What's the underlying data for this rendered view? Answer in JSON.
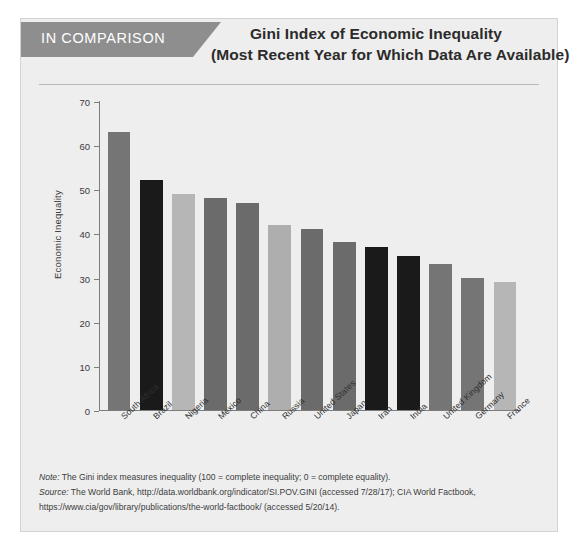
{
  "banner": {
    "label": "IN COMPARISON"
  },
  "header": {
    "title_line1": "Gini Index of Economic Inequality",
    "title_line2": "(Most Recent Year for Which Data Are Available)"
  },
  "notes": {
    "note_tag": "Note:",
    "note_text": " The Gini index measures inequality (100 = complete inequality; 0 = complete equality).",
    "source_tag": "Source:",
    "source_text": " The World Bank, http://data.worldbank.org/indicator/SI.POV.GINI (accessed 7/28/17); CIA World Factbook,",
    "source_text2": "https://www.cia/gov/library/publications/the-world-factbook/ (accessed 5/20/14)."
  },
  "colors": {
    "card_background": "#eeeeee",
    "ribbon": "#8e8e8e",
    "axis": "#7d7d7d",
    "bar_dark": "#1a1a1a",
    "bar_medium": "#757575",
    "bar_medium_dark": "#6b6b6b",
    "bar_light": "#b6b6b6"
  },
  "chart_data": {
    "type": "bar",
    "title": "Gini Index of Economic Inequality (Most Recent Year for Which Data Are Available)",
    "xlabel": "",
    "ylabel": "Economic Inequality",
    "ylim": [
      0,
      70
    ],
    "yticks": [
      0,
      10,
      20,
      30,
      40,
      50,
      60,
      70
    ],
    "grid": false,
    "legend": "none",
    "categories": [
      "South Africa",
      "Brazil",
      "Nigeria",
      "Mexico",
      "China",
      "Russia",
      "United States",
      "Japan",
      "Iran",
      "India",
      "United Kingdom",
      "Germany",
      "France"
    ],
    "values": [
      63,
      52,
      49,
      48,
      47,
      42,
      41,
      38,
      37,
      35,
      33,
      30,
      29
    ],
    "bar_colors": [
      "#757575",
      "#1a1a1a",
      "#b6b6b6",
      "#6b6b6b",
      "#6b6b6b",
      "#aeaeae",
      "#6b6b6b",
      "#6b6b6b",
      "#1a1a1a",
      "#1a1a1a",
      "#757575",
      "#757575",
      "#b6b6b6"
    ]
  }
}
